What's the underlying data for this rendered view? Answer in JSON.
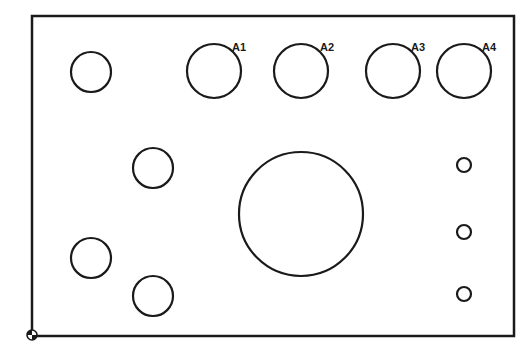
{
  "diagram": {
    "type": "hole-pattern-plate",
    "stroke_color": "#1a1a1a",
    "background": "#ffffff",
    "plate": {
      "x": 32,
      "y": 16,
      "width": 482,
      "height": 320
    },
    "origin_marker": {
      "cx": 32,
      "cy": 335,
      "r": 5
    },
    "labeled_holes": [
      {
        "label": "A1",
        "cx": 214,
        "cy": 71,
        "r": 27,
        "label_x": 232,
        "label_y": 51
      },
      {
        "label": "A2",
        "cx": 301,
        "cy": 71,
        "r": 27,
        "label_x": 320,
        "label_y": 51
      },
      {
        "label": "A3",
        "cx": 393,
        "cy": 71,
        "r": 27,
        "label_x": 411,
        "label_y": 51
      },
      {
        "label": "A4",
        "cx": 464,
        "cy": 71,
        "r": 27,
        "label_x": 482,
        "label_y": 51
      }
    ],
    "medium_holes": [
      {
        "cx": 91,
        "cy": 72,
        "r": 20
      },
      {
        "cx": 153,
        "cy": 168,
        "r": 20
      },
      {
        "cx": 91,
        "cy": 258,
        "r": 20
      },
      {
        "cx": 153,
        "cy": 296,
        "r": 20
      }
    ],
    "large_hole": {
      "cx": 301,
      "cy": 214,
      "r": 62
    },
    "small_holes": [
      {
        "cx": 464,
        "cy": 165,
        "r": 7
      },
      {
        "cx": 464,
        "cy": 232,
        "r": 7
      },
      {
        "cx": 464,
        "cy": 294,
        "r": 7
      }
    ]
  }
}
